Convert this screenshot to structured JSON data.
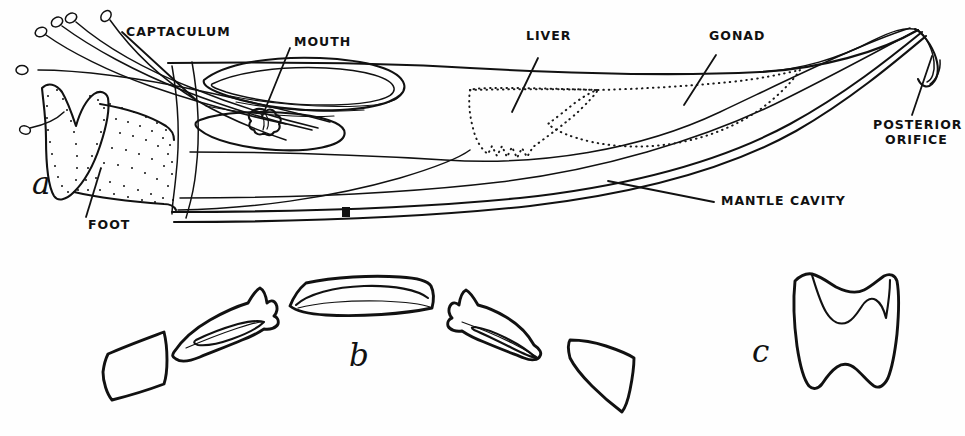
{
  "figure": {
    "background_color": "#fefefe",
    "ink_color": "#111111",
    "panels": [
      {
        "id": "a",
        "letter": "a",
        "caption": "Whole animal, shell partly removed, left side view"
      },
      {
        "id": "b",
        "letter": "b",
        "caption": "Radula teeth, one transverse row spread out"
      },
      {
        "id": "c",
        "letter": "c",
        "caption": "Central (rachidian) tooth, enlarged"
      }
    ]
  },
  "labels": {
    "captaculum": "CAPTACULUM",
    "mouth": "MOUTH",
    "liver": "LIVER",
    "gonad": "GONAD",
    "posterior_orifice_line1": "POSTERIOR",
    "posterior_orifice_line2": "ORIFICE",
    "mantle_cavity": "MANTLE CAVITY",
    "foot": "FOOT"
  },
  "panel_letters": {
    "a": "a",
    "b": "b",
    "c": "c"
  },
  "structures": {
    "captacula_count": 5,
    "radula_teeth_count": 5,
    "radula_tooth_names": [
      "marginal-plate-left",
      "lateral-tooth-left",
      "central-tooth",
      "lateral-tooth-right",
      "marginal-plate-right"
    ]
  }
}
